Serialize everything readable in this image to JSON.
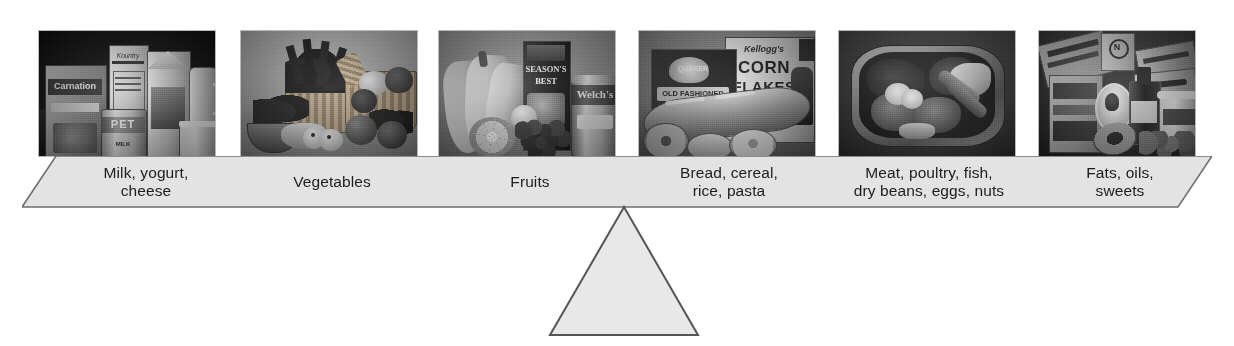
{
  "diagram": {
    "type": "balance-beam",
    "beam_color": "#e3e3e3",
    "beam_border_color": "#6f6f6f",
    "fulcrum_color": "#e8e8e8",
    "fulcrum_border_color": "#555555",
    "label_text_color": "#1d1d1d",
    "background_color": "#ffffff"
  },
  "groups": [
    {
      "id": "dairy",
      "label_line1": "Milk, yogurt,",
      "label_line2": "cheese",
      "photo_alt": "Carnation box, PET evaporated milk can, milk carton, pitcher and yogurt cup",
      "photo_items": [
        "Carnation",
        "PET",
        "MILK",
        "Kountry"
      ]
    },
    {
      "id": "vegetables",
      "label_line1": "Vegetables",
      "label_line2": "",
      "photo_alt": "Baskets of leafy greens, squash, mushrooms and tomatoes",
      "photo_items": []
    },
    {
      "id": "fruits",
      "label_line1": "Fruits",
      "label_line2": "",
      "photo_alt": "Bananas, orange half, grapes, juice carton and Welch's can",
      "photo_items": [
        "SEASON'S BEST",
        "Welch's"
      ]
    },
    {
      "id": "grains",
      "label_line1": "Bread, cereal,",
      "label_line2": "rice, pasta",
      "photo_alt": "Kellogg's Corn Flakes box, oat box, baguette and bagels",
      "photo_items": [
        "Kellogg's",
        "CORN",
        "FLAKES",
        "QUAKER"
      ]
    },
    {
      "id": "protein",
      "label_line1": "Meat, poultry, fish,",
      "label_line2": "dry beans, eggs, nuts",
      "photo_alt": "Metal platter with meat, fish, sausages and egg",
      "photo_items": []
    },
    {
      "id": "fats",
      "label_line1": "Fats, oils,",
      "label_line2": "sweets",
      "photo_alt": "Candy boxes, avocado, oil bottle, ice cream tub and nuts",
      "photo_items": []
    }
  ]
}
